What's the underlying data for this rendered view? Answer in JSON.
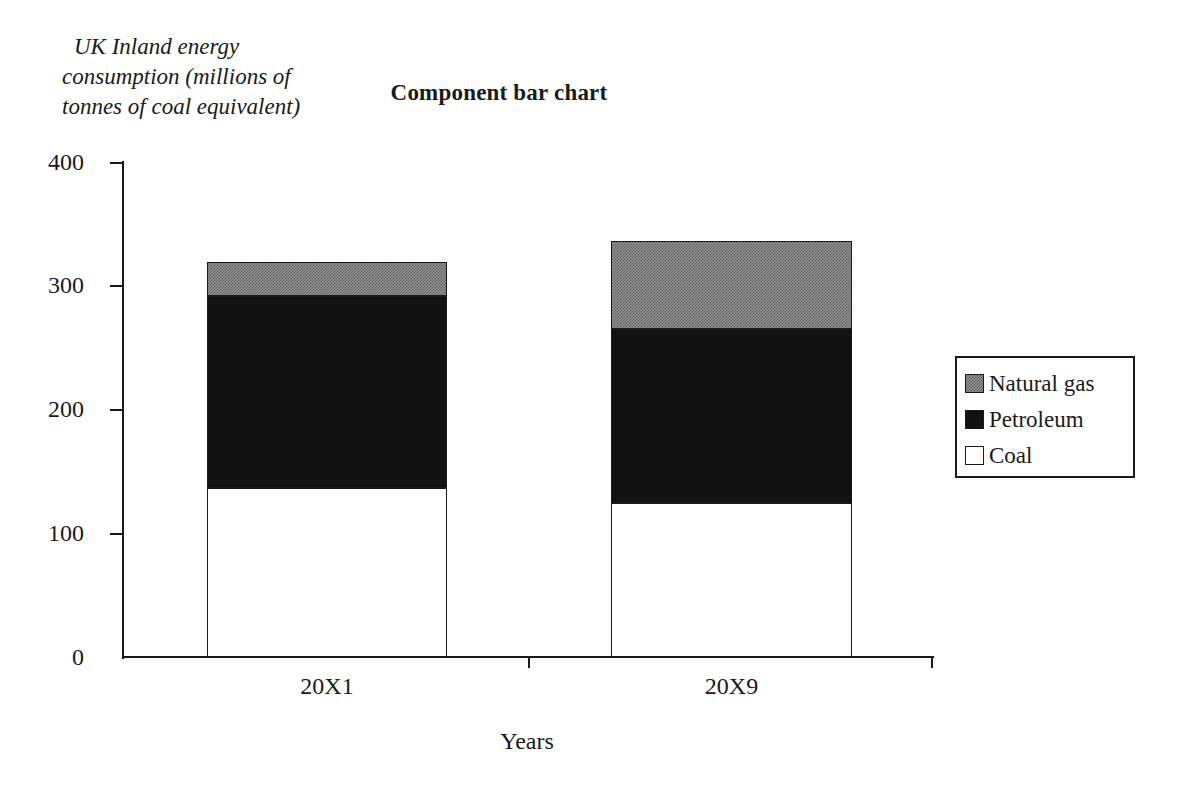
{
  "chart_data": {
    "type": "bar",
    "subtype": "stacked-component",
    "title": "Component bar chart",
    "xlabel": "Years",
    "ylabel": "UK Inland energy consumption (millions of tonnes of coal equivalent)",
    "ylabel_lines": [
      "UK Inland energy",
      "consumption (millions of",
      "tonnes of coal equivalent)"
    ],
    "categories": [
      "20X1",
      "20X9"
    ],
    "series": [
      {
        "name": "Coal",
        "values": [
          137,
          125
        ],
        "color": "#ffffff"
      },
      {
        "name": "Petroleum",
        "values": [
          155,
          141
        ],
        "color": "#111111"
      },
      {
        "name": "Natural gas",
        "values": [
          28,
          71
        ],
        "color": "#8c8c8c"
      }
    ],
    "totals": [
      320,
      337
    ],
    "stack_order_bottom_to_top": [
      "Coal",
      "Petroleum",
      "Natural gas"
    ],
    "ylim": [
      0,
      400
    ],
    "yticks": [
      0,
      100,
      200,
      300,
      400
    ],
    "ytick_labels": [
      "0",
      "100",
      "200",
      "300",
      "400"
    ],
    "grid": false,
    "legend_position": "right"
  },
  "axes": {
    "y": {
      "ticks": [
        {
          "label": "400",
          "value": 400
        },
        {
          "label": "300",
          "value": 300
        },
        {
          "label": "200",
          "value": 200
        },
        {
          "label": "100",
          "value": 100
        },
        {
          "label": "0",
          "value": 0
        }
      ]
    },
    "x": {
      "title": "Years",
      "categories": [
        {
          "label": "20X1"
        },
        {
          "label": "20X9"
        }
      ]
    }
  },
  "legend": {
    "entries": [
      {
        "label": "Natural gas",
        "swatch": "gas"
      },
      {
        "label": "Petroleum",
        "swatch": "petroleum"
      },
      {
        "label": "Coal",
        "swatch": "coal"
      }
    ]
  }
}
